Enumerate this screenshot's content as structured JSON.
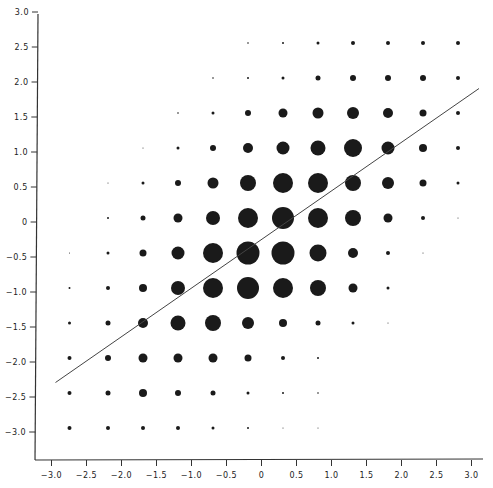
{
  "chart_data": {
    "type": "scatter",
    "subtype": "bubble-grid",
    "title": "",
    "xlabel": "",
    "ylabel": "",
    "xlim": [
      -3.15,
      3.2
    ],
    "ylim": [
      -3.25,
      3.05
    ],
    "grid": false,
    "legend": null,
    "x_ticks": [
      "-3.0",
      "-2.5",
      "-2.0",
      "-1.5",
      "-1.0",
      "-0.5",
      "0",
      "0.5",
      "1.0",
      "1.5",
      "2.0",
      "2.5",
      "3.0"
    ],
    "y_ticks": [
      "3.0",
      "2.5",
      "2.0",
      "1.5",
      "1.0",
      "0.5",
      "0",
      "-0.5",
      "-1.0",
      "-1.5",
      "-2.0",
      "-2.5",
      "-3.0"
    ],
    "grid_x": [
      -2.75,
      -2.2,
      -1.7,
      -1.2,
      -0.7,
      -0.2,
      0.3,
      0.8,
      1.3,
      1.8,
      2.3,
      2.8
    ],
    "grid_y": [
      2.7,
      2.2,
      1.7,
      1.2,
      0.7,
      0.2,
      -0.3,
      -0.8,
      -1.3,
      -1.8,
      -2.3,
      -2.8
    ],
    "bubble_radius_px": [
      [
        0,
        0,
        0,
        0,
        0,
        0.8,
        1,
        1.5,
        2,
        2,
        2,
        2
      ],
      [
        0,
        0,
        0,
        0,
        0.8,
        1,
        1.5,
        2.5,
        3,
        3,
        3,
        2
      ],
      [
        0,
        0,
        0,
        0.8,
        1.5,
        3,
        4.5,
        5.5,
        6,
        5,
        3.5,
        2
      ],
      [
        0,
        0,
        0.5,
        1.5,
        3,
        5,
        6.5,
        7.5,
        9,
        6.5,
        4,
        2
      ],
      [
        0,
        0.5,
        1.5,
        3,
        5.5,
        8,
        10,
        10,
        8,
        6,
        3.5,
        1.5
      ],
      [
        0,
        1,
        2.5,
        4.5,
        7,
        10,
        11,
        10,
        8,
        4.5,
        2,
        0.5
      ],
      [
        0.5,
        1.5,
        3.5,
        6.5,
        10,
        11.5,
        11.5,
        8.5,
        5,
        2,
        0.5,
        0
      ],
      [
        1,
        2,
        4,
        7,
        10,
        11,
        10,
        8,
        4.5,
        1.5,
        0,
        0
      ],
      [
        1.5,
        2.5,
        5,
        7.5,
        8,
        6,
        4,
        2.5,
        1.5,
        0.5,
        0,
        0
      ],
      [
        2,
        3,
        4.5,
        4.5,
        4.5,
        3.5,
        2,
        1,
        0,
        0,
        0,
        0
      ],
      [
        2,
        2.5,
        4,
        3,
        2.5,
        1.5,
        1,
        0.8,
        0,
        0,
        0,
        0
      ],
      [
        2,
        2,
        2,
        2,
        1.5,
        1,
        0.5,
        0.5,
        0,
        0,
        0,
        0
      ]
    ],
    "regression_line": {
      "x": [
        -2.95,
        3.1
      ],
      "y": [
        -2.15,
        2.05
      ]
    },
    "colors": {
      "bubble": "#1a1a1a",
      "axis": "#333333",
      "line": "#444444"
    }
  }
}
